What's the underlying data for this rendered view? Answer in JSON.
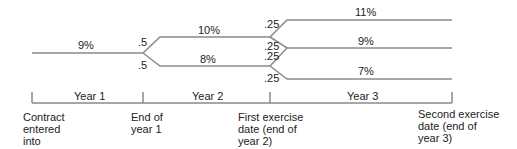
{
  "tree": {
    "root_rate": "9%",
    "year2": {
      "up_prob": ".5",
      "down_prob": ".5",
      "up_rate": "10%",
      "down_rate": "8%"
    },
    "year3": {
      "probs": [
        ".25",
        ".25",
        ".25",
        ".25"
      ],
      "rates": [
        "11%",
        "9%",
        "7%"
      ]
    }
  },
  "timeline": {
    "periods": [
      "Year 1",
      "Year 2",
      "Year 3"
    ],
    "points": [
      "Contract\nentered\ninto",
      "End of\nyear 1",
      "First exercise\ndate (end of\nyear 2)",
      "Second exercise\ndate (end of\nyear 3)"
    ]
  },
  "colors": {
    "line": "#8a8a8a",
    "text": "#222222"
  }
}
